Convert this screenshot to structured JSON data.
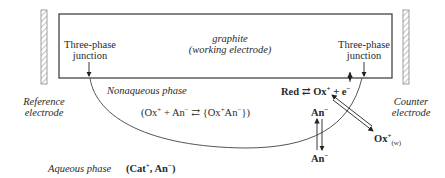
{
  "diagram": {
    "working_electrode": {
      "line1": "graphite",
      "line2": "(working electrode)"
    },
    "reference_electrode": {
      "line1": "Reference",
      "line2": "electrode"
    },
    "counter_electrode": {
      "line1": "Counter",
      "line2": "electrode"
    },
    "junction_left": {
      "line1": "Three-phase",
      "line2": "junction"
    },
    "junction_right": {
      "line1": "Three-phase",
      "line2": "junction"
    },
    "nonaqueous_phase_label": "Nonaqueous phase",
    "aqueous_phase_label": "Aqueous phase",
    "ion_pair_equilibrium": {
      "left": "(Ox",
      "left_sup": "+",
      "mid": " + An",
      "mid_sup": "−",
      "arrow": "⇄",
      "right": "{Ox",
      "right_sup": "+",
      "right2": "An",
      "right2_sup": "−",
      "close": "})"
    },
    "redox_reaction": {
      "red": "Red",
      "arrow": "⇄",
      "ox": "Ox",
      "ox_sup": "+",
      "plus": " + e",
      "e_sup": "−"
    },
    "anion_organic": {
      "text": "An",
      "sup": "−"
    },
    "anion_aqueous": {
      "text": "An",
      "sup": "−"
    },
    "ox_aqueous": {
      "text": "Ox",
      "sup": "+",
      "sub": "(w)"
    },
    "aqueous_electrolyte": {
      "open": "(Cat",
      "cat_sup": "+",
      "sep": ", An",
      "an_sup": "−",
      "close": ")"
    }
  }
}
